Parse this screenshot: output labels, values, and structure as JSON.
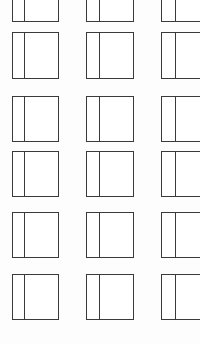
{
  "canvas": {
    "width": 200,
    "height": 344,
    "background_color": "#fdfdfd",
    "line_color": "#3a3a3a",
    "pane_fill_color": "#ffffff",
    "line_width_px": 1,
    "description": "grid-of-window-outlines"
  },
  "grid": {
    "columns": 3,
    "rows": 6,
    "column_x": [
      12,
      86,
      161
    ],
    "column_width": [
      47,
      48,
      48
    ],
    "row_y": [
      -24,
      32,
      96,
      151,
      212,
      274
    ],
    "row_height": [
      46,
      47,
      46,
      46,
      46,
      46
    ],
    "divider_offset_ratio": 0.24,
    "clipped_top_row": true,
    "clipped_right_column": true
  },
  "cells": [
    {
      "id": "r1c1",
      "row": 1,
      "col": 1,
      "x": 12,
      "y": -24,
      "w": 47,
      "h": 46,
      "divider_x": 11,
      "clipped": "top"
    },
    {
      "id": "r1c2",
      "row": 1,
      "col": 2,
      "x": 86,
      "y": -24,
      "w": 48,
      "h": 46,
      "divider_x": 12,
      "clipped": "top"
    },
    {
      "id": "r1c3",
      "row": 1,
      "col": 3,
      "x": 161,
      "y": -24,
      "w": 48,
      "h": 46,
      "divider_x": 13,
      "clipped": "top-right"
    },
    {
      "id": "r2c1",
      "row": 2,
      "col": 1,
      "x": 12,
      "y": 32,
      "w": 47,
      "h": 47,
      "divider_x": 11,
      "clipped": "none"
    },
    {
      "id": "r2c2",
      "row": 2,
      "col": 2,
      "x": 86,
      "y": 32,
      "w": 48,
      "h": 47,
      "divider_x": 12,
      "clipped": "none"
    },
    {
      "id": "r2c3",
      "row": 2,
      "col": 3,
      "x": 161,
      "y": 32,
      "w": 48,
      "h": 47,
      "divider_x": 13,
      "clipped": "right"
    },
    {
      "id": "r3c1",
      "row": 3,
      "col": 1,
      "x": 12,
      "y": 96,
      "w": 47,
      "h": 46,
      "divider_x": 11,
      "clipped": "none"
    },
    {
      "id": "r3c2",
      "row": 3,
      "col": 2,
      "x": 86,
      "y": 96,
      "w": 48,
      "h": 46,
      "divider_x": 12,
      "clipped": "none"
    },
    {
      "id": "r3c3",
      "row": 3,
      "col": 3,
      "x": 161,
      "y": 96,
      "w": 48,
      "h": 46,
      "divider_x": 13,
      "clipped": "right"
    },
    {
      "id": "r4c1",
      "row": 4,
      "col": 1,
      "x": 12,
      "y": 151,
      "w": 47,
      "h": 46,
      "divider_x": 11,
      "clipped": "none"
    },
    {
      "id": "r4c2",
      "row": 4,
      "col": 2,
      "x": 86,
      "y": 151,
      "w": 48,
      "h": 46,
      "divider_x": 12,
      "clipped": "none"
    },
    {
      "id": "r4c3",
      "row": 4,
      "col": 3,
      "x": 161,
      "y": 151,
      "w": 48,
      "h": 46,
      "divider_x": 13,
      "clipped": "right"
    },
    {
      "id": "r5c1",
      "row": 5,
      "col": 1,
      "x": 12,
      "y": 212,
      "w": 47,
      "h": 46,
      "divider_x": 11,
      "clipped": "none"
    },
    {
      "id": "r5c2",
      "row": 5,
      "col": 2,
      "x": 86,
      "y": 212,
      "w": 48,
      "h": 46,
      "divider_x": 12,
      "clipped": "none"
    },
    {
      "id": "r5c3",
      "row": 5,
      "col": 3,
      "x": 161,
      "y": 212,
      "w": 48,
      "h": 46,
      "divider_x": 13,
      "clipped": "right"
    },
    {
      "id": "r6c1",
      "row": 6,
      "col": 1,
      "x": 12,
      "y": 274,
      "w": 47,
      "h": 46,
      "divider_x": 11,
      "clipped": "none"
    },
    {
      "id": "r6c2",
      "row": 6,
      "col": 2,
      "x": 86,
      "y": 274,
      "w": 48,
      "h": 46,
      "divider_x": 12,
      "clipped": "none"
    },
    {
      "id": "r6c3",
      "row": 6,
      "col": 3,
      "x": 161,
      "y": 274,
      "w": 48,
      "h": 46,
      "divider_x": 13,
      "clipped": "right"
    }
  ]
}
